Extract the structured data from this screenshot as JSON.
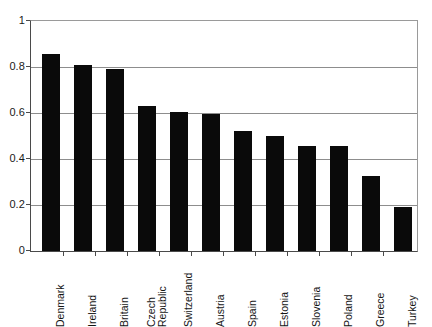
{
  "chart_data": {
    "type": "bar",
    "title": "",
    "subtitle": "",
    "xlabel": "",
    "ylabel": "",
    "categories": [
      "Denmark",
      "Ireland",
      "Britain",
      "Czech Republic",
      "Switzerland",
      "Austria",
      "Spain",
      "Estonia",
      "Slovenia",
      "Poland",
      "Greece",
      "Turkey"
    ],
    "values": [
      0.855,
      0.81,
      0.79,
      0.63,
      0.605,
      0.595,
      0.52,
      0.5,
      0.455,
      0.455,
      0.325,
      0.19
    ],
    "series": [
      {
        "name": "",
        "values": [
          0.855,
          0.81,
          0.79,
          0.63,
          0.605,
          0.595,
          0.52,
          0.5,
          0.455,
          0.455,
          0.325,
          0.19
        ]
      }
    ],
    "ylim": [
      0,
      1
    ],
    "yticks": [
      0,
      0.2,
      0.4,
      0.6,
      0.8,
      1
    ],
    "ytick_labels": [
      "0",
      "0.2",
      "0.4",
      "0.6",
      "0.8",
      "1"
    ],
    "grid": "horizontal",
    "legend": "none",
    "bar_color": "#0a0a0a",
    "grid_color": "#8d8d8d",
    "axis_color": "#4a4a4a",
    "background": "#ffffff",
    "label_rotation": -90,
    "label_wraps": {
      "Czech Republic": [
        "Czech",
        "Republic"
      ]
    }
  }
}
